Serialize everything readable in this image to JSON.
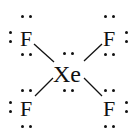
{
  "diagram": {
    "type": "lewis-structure",
    "molecule": "XeF4",
    "central_atom": {
      "symbol": "Xe",
      "lone_pairs": 2
    },
    "outer_atoms": [
      {
        "position": "top-left",
        "symbol": "F",
        "lone_pairs": 3
      },
      {
        "position": "top-right",
        "symbol": "F",
        "lone_pairs": 3
      },
      {
        "position": "bottom-left",
        "symbol": "F",
        "lone_pairs": 3
      },
      {
        "position": "bottom-right",
        "symbol": "F",
        "lone_pairs": 3
      }
    ],
    "bonds": [
      {
        "from": "Xe",
        "to": "top-left",
        "order": 1
      },
      {
        "from": "Xe",
        "to": "top-right",
        "order": 1
      },
      {
        "from": "Xe",
        "to": "bottom-left",
        "order": 1
      },
      {
        "from": "Xe",
        "to": "bottom-right",
        "order": 1
      }
    ],
    "colors": {
      "ink": "#111111",
      "background": "#ffffff"
    }
  }
}
